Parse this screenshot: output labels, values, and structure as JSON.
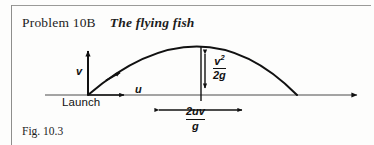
{
  "page": {
    "background_color": "#fdfdfc",
    "ink_color": "#111111",
    "rule_color": "#9a9a98"
  },
  "heading": {
    "problem_number": "Problem 10B",
    "problem_title": "The flying fish"
  },
  "figure_caption": "Fig. 10.3",
  "diagram": {
    "name": "projectile-trajectory-diagram",
    "labels": {
      "vertical_velocity": "v",
      "horizontal_velocity": "u",
      "origin": "Launch",
      "max_height_numerator": "v",
      "max_height_numerator_exponent": "2",
      "max_height_denominator": "2g",
      "range_numerator": "2uv",
      "range_denominator": "g"
    },
    "annotations": {
      "max_height_expression": "v^2 / 2g",
      "half_range_expression": "2uv / g"
    },
    "geometry": {
      "baseline_y": 95,
      "launch_x": 88,
      "apex_x": 201,
      "apex_y": 47,
      "landing_x": 297,
      "axis_end_x": 361,
      "v_arrow_top_y": 48,
      "u_arrow_end_x": 128,
      "range_left_x": 158,
      "range_right_x": 243,
      "range_y": 110
    }
  }
}
